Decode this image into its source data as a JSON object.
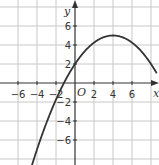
{
  "chart_data": {
    "type": "line",
    "title": "",
    "xlabel": "x",
    "ylabel": "y",
    "origin_label": "O",
    "xlim": [
      -7.8,
      8.6
    ],
    "ylim": [
      -8.6,
      8.6
    ],
    "grid": true,
    "grid_step": 2,
    "x_ticks": [
      -6,
      -4,
      -2,
      2,
      4,
      6
    ],
    "y_ticks": [
      6,
      4,
      2,
      -2,
      -4,
      -6
    ],
    "x_tick_labels": [
      "−6",
      "−4",
      "−2",
      "2",
      "4",
      "6"
    ],
    "y_tick_labels": [
      "6",
      "4",
      "2",
      "−2",
      "−4",
      "−6"
    ],
    "series": [
      {
        "name": "parabola",
        "description": "downward-opening parabola, vertex (4, 5), y-intercept 2",
        "equation": "y = -3/16 (x - 4)^2 + 5",
        "vertex": [
          4,
          5
        ],
        "x": [
          -4.3,
          -4,
          -3,
          -2,
          -1,
          0,
          1,
          2,
          3,
          4,
          5,
          6,
          7,
          7.6
        ],
        "y": [
          -7.9,
          -7,
          -4.19,
          -1.75,
          0.31,
          2,
          3.31,
          4.25,
          4.81,
          5,
          4.81,
          4.25,
          3.31,
          2.57
        ],
        "color": "#333333"
      }
    ]
  }
}
